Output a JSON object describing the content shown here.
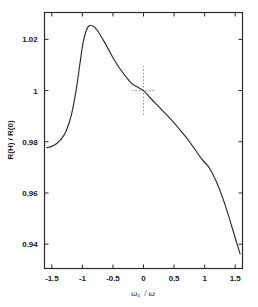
{
  "chart_data": {
    "type": "line",
    "title": "",
    "xlabel": "ωc / ω",
    "ylabel": "R(H) / R(0)",
    "xlim": [
      -1.62,
      1.62
    ],
    "ylim": [
      0.9305,
      1.0305
    ],
    "grid": false,
    "legend": null,
    "xticks": [
      -1.5,
      -1,
      -0.5,
      0,
      0.5,
      1,
      1.5
    ],
    "xtick_labels": [
      "-1.5",
      "-1",
      "-0.5",
      "0",
      "0.5",
      "1",
      "1.5"
    ],
    "yticks": [
      0.94,
      0.96,
      0.98,
      1,
      1.02
    ],
    "ytick_labels": [
      "0.94",
      "0.96",
      "0.98",
      "1",
      "1.02"
    ],
    "series": [
      {
        "name": "R(H)/R(0)",
        "color": "#2b2b2b",
        "style": "solid",
        "x": [
          -1.58,
          -1.5,
          -1.42,
          -1.34,
          -1.26,
          -1.18,
          -1.1,
          -1.04,
          -0.99,
          -0.95,
          -0.91,
          -0.88,
          -0.84,
          -0.8,
          -0.74,
          -0.66,
          -0.58,
          -0.5,
          -0.4,
          -0.3,
          -0.2,
          -0.1,
          0.0,
          0.1,
          0.2,
          0.3,
          0.4,
          0.5,
          0.6,
          0.7,
          0.78,
          0.86,
          0.93,
          0.99,
          1.05,
          1.12,
          1.2,
          1.3,
          1.4,
          1.5,
          1.58
        ],
        "y": [
          0.9777,
          0.9782,
          0.9793,
          0.9812,
          0.9845,
          0.9905,
          1.0005,
          1.0105,
          1.0185,
          1.0225,
          1.0248,
          1.0254,
          1.0253,
          1.0247,
          1.023,
          1.0198,
          1.0164,
          1.0128,
          1.009,
          1.0058,
          1.0029,
          1.0014,
          1.0,
          0.9974,
          0.9949,
          0.9925,
          0.99,
          0.9874,
          0.9846,
          0.9817,
          0.9791,
          0.9764,
          0.974,
          0.9722,
          0.9707,
          0.968,
          0.964,
          0.9578,
          0.9505,
          0.9425,
          0.9362
        ]
      }
    ],
    "annotations": [
      {
        "name": "crosshair",
        "style": "dashed",
        "color": "#9a9a9a",
        "x": 0,
        "y": 1,
        "x_span": [
          -0.19,
          0.19
        ],
        "y_span": [
          0.9905,
          1.0095
        ]
      }
    ]
  },
  "figure": {
    "frame_color": "#2b2b2b",
    "background": "#ffffff"
  }
}
